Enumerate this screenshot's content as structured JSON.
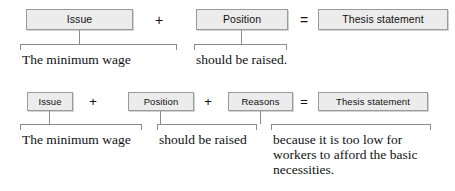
{
  "figure": {
    "box_fill": "#ececec",
    "box_border": "#9a9a9a",
    "text_color": "#111111"
  },
  "rows": [
    {
      "id": "row-1",
      "formula": [
        {
          "type": "box",
          "label": "Issue"
        },
        {
          "type": "operator",
          "label": "+"
        },
        {
          "type": "box",
          "label": "Position"
        },
        {
          "type": "operator",
          "label": "="
        },
        {
          "type": "box",
          "label": "Thesis statement"
        }
      ],
      "captions": [
        "The minimum wage",
        "should be raised."
      ]
    },
    {
      "id": "row-2",
      "formula": [
        {
          "type": "box",
          "label": "Issue"
        },
        {
          "type": "operator",
          "label": "+"
        },
        {
          "type": "box",
          "label": "Position"
        },
        {
          "type": "operator",
          "label": "+"
        },
        {
          "type": "box",
          "label": "Reasons"
        },
        {
          "type": "operator",
          "label": "="
        },
        {
          "type": "box",
          "label": "Thesis statement"
        }
      ],
      "captions": [
        "The minimum wage",
        "should be raised",
        "because it is too low for workers to afford the basic necessities."
      ]
    }
  ]
}
